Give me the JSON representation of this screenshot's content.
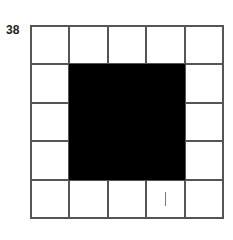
{
  "label": "38",
  "grid": {
    "rows": 5,
    "cols": 5,
    "filled_region": {
      "row_start": 1,
      "row_end": 3,
      "col_start": 1,
      "col_end": 3
    },
    "marks": [
      {
        "row": 4,
        "col": 3,
        "symbol": "|"
      }
    ],
    "fill_color": "#000000"
  }
}
